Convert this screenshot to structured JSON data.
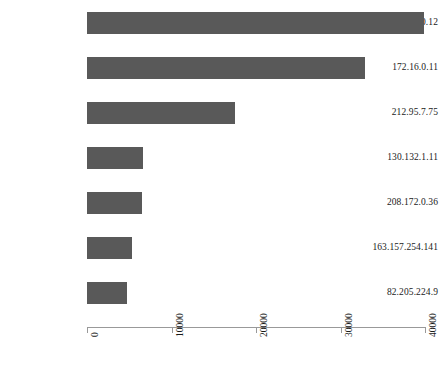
{
  "chart_data": {
    "type": "bar",
    "orientation": "horizontal",
    "title": "",
    "subtitle": "",
    "xlabel": "",
    "ylabel": "",
    "grid": false,
    "legend": false,
    "legend_position": "none",
    "bar_color": "#595959",
    "axis_color": "#999999",
    "text_color": "#1a1a1a",
    "background_color": "#ffffff",
    "xlim": [
      0,
      40000
    ],
    "xticks": [
      0,
      10000,
      20000,
      30000,
      40000
    ],
    "xtick_labels": [
      "0",
      "10000",
      "20000",
      "30000",
      "40000"
    ],
    "xtick_rotation": -90,
    "categories": [
      "172.16.0.12",
      "172.16.0.11",
      "212.95.7.75",
      "130.132.1.11",
      "208.172.0.36",
      "163.157.254.141",
      "82.205.224.9"
    ],
    "values": [
      39900,
      32900,
      17500,
      6600,
      6500,
      5300,
      4700
    ]
  },
  "axis": {
    "tick_labels": [
      "0",
      "10000",
      "20000",
      "30000",
      "40000"
    ]
  }
}
